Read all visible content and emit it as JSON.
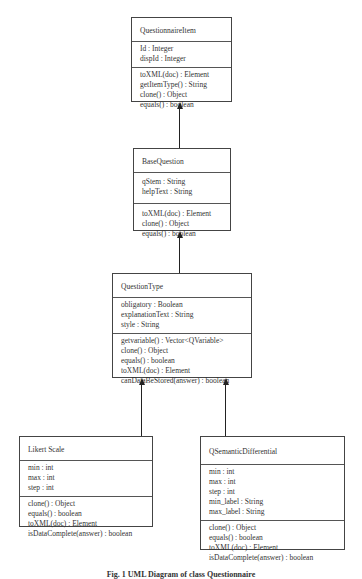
{
  "diagram": {
    "type": "uml-class-diagram",
    "classes": [
      {
        "name": "QuestionnaireItem",
        "attributes": [
          "Id : Integer",
          "dispId : Integer"
        ],
        "methods": [
          "toXML(doc) : Element",
          "getItemType() : String",
          "clone() : Object",
          "equals() : boolean"
        ]
      },
      {
        "name": "BaseQuestion",
        "attributes": [
          "qStem : String",
          "helpText : String"
        ],
        "methods": [
          "toXML(doc) : Element",
          "clone() : Object",
          "equals() : boolean"
        ]
      },
      {
        "name": "QuestionType",
        "attributes": [
          "obligatory : Boolean",
          "explanationText : String",
          "style : String"
        ],
        "methods": [
          "getvariable() : Vector<QVariable>",
          "clone() : Object",
          "equals() : boolean",
          "toXML(doc) : Element",
          "canDataBeStored(answer) : boolean"
        ]
      },
      {
        "name": "Likert Scale",
        "attributes": [
          "min : int",
          "max : int",
          "step : int"
        ],
        "methods": [
          "clone() : Object",
          "equals() : boolean",
          "toXML(doc) : Element",
          "isDataComplete(answer) : boolean"
        ]
      },
      {
        "name": "QSemanticDifferential",
        "attributes": [
          "min : int",
          "max : int",
          "step : int",
          "min_label : String",
          "max_label : String"
        ],
        "methods": [
          "clone() : Object",
          "equals() : boolean",
          "toXML(doc) : Element",
          "isDataComplete(answer) : boolean"
        ]
      }
    ],
    "relations": [
      {
        "from": "BaseQuestion",
        "to": "QuestionnaireItem",
        "type": "inheritance"
      },
      {
        "from": "QuestionType",
        "to": "BaseQuestion",
        "type": "inheritance"
      },
      {
        "from": "Likert Scale",
        "to": "QuestionType",
        "type": "inheritance"
      },
      {
        "from": "QSemanticDifferential",
        "to": "QuestionType",
        "type": "inheritance"
      }
    ],
    "caption": "Fig. 1 UML Diagram of class Questionnaire"
  }
}
